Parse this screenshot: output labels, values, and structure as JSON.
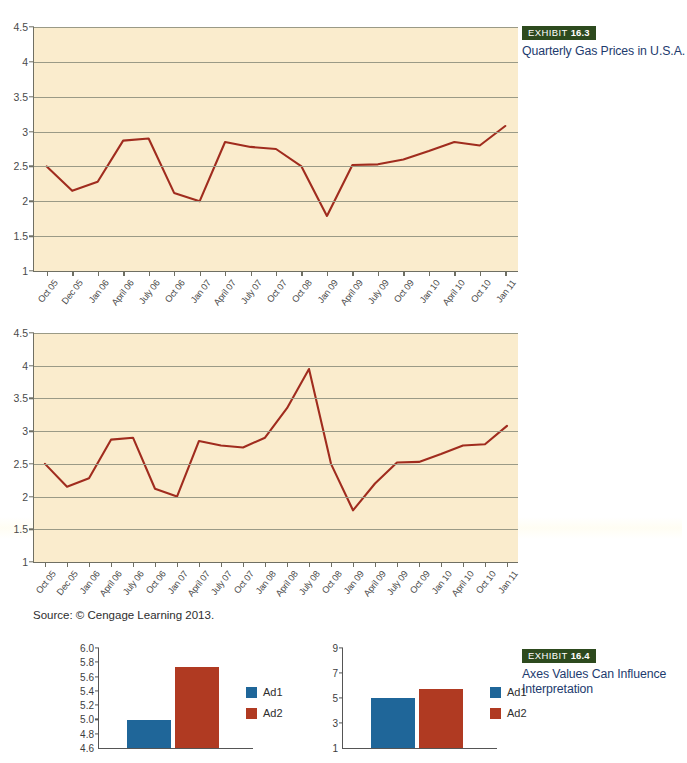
{
  "exhibits": [
    {
      "badge_word": "EXHIBIT",
      "number": "16.3",
      "title": "Quarterly Gas Prices in U.S.A.",
      "badge_color": "#2d4a1e",
      "title_color": "#1d3b6e"
    },
    {
      "badge_word": "EXHIBIT",
      "number": "16.4",
      "title": "Axes Values Can Influence Interpretation",
      "badge_color": "#2d4a1e",
      "title_color": "#1d3b6e"
    }
  ],
  "source_note": "Source: © Cengage Learning 2013.",
  "colors": {
    "plot_background": "#faeccd",
    "line": "#a02c1e",
    "gridline": "#9a9a86",
    "axis": "#6f6f63",
    "ad1_blue": "#1f6699",
    "ad2_red": "#b03a22"
  },
  "chart_data": [
    {
      "type": "line",
      "title": "Quarterly Gas Prices in U.S.A.",
      "id": "gas-prices-compressed-x",
      "xlabel": "",
      "ylabel": "",
      "ylim": [
        1,
        4.5
      ],
      "yticks": [
        1,
        1.5,
        2,
        2.5,
        3,
        3.5,
        4,
        4.5
      ],
      "grid": true,
      "legend": "none",
      "categories": [
        "Oct 05",
        "Dec 05",
        "Jan 06",
        "April 06",
        "July 06",
        "Oct 06",
        "Jan 07",
        "April 07",
        "July 07",
        "Oct 07",
        "Oct 08",
        "Jan 09",
        "April 09",
        "July 09",
        "Oct 09",
        "Jan 10",
        "April 10",
        "Oct 10",
        "Jan 11"
      ],
      "values": [
        2.5,
        2.15,
        2.28,
        2.87,
        2.9,
        2.12,
        2.0,
        2.85,
        2.78,
        2.75,
        2.5,
        1.79,
        2.52,
        2.53,
        2.6,
        2.72,
        2.85,
        2.8,
        3.08
      ]
    },
    {
      "type": "line",
      "title": "Quarterly Gas Prices in U.S.A.",
      "id": "gas-prices-full-x",
      "xlabel": "",
      "ylabel": "",
      "ylim": [
        1,
        4.5
      ],
      "yticks": [
        1,
        1.5,
        2,
        2.5,
        3,
        3.5,
        4,
        4.5
      ],
      "grid": true,
      "legend": "none",
      "categories": [
        "Oct 05",
        "Dec 05",
        "Jan 06",
        "April 06",
        "July 06",
        "Oct 06",
        "Jan 07",
        "April 07",
        "July 07",
        "Oct 07",
        "Jan 08",
        "April 08",
        "July 08",
        "Oct 08",
        "Jan 09",
        "April 09",
        "July 09",
        "Oct 09",
        "Jan 10",
        "April 10",
        "Oct 10",
        "Jan 11"
      ],
      "values": [
        2.5,
        2.15,
        2.28,
        2.87,
        2.9,
        2.12,
        2.0,
        2.85,
        2.78,
        2.75,
        2.9,
        3.35,
        3.95,
        2.5,
        1.79,
        2.2,
        2.52,
        2.53,
        2.65,
        2.78,
        2.8,
        3.08
      ]
    },
    {
      "type": "bar",
      "id": "ad-comparison-zoomed-axis",
      "title": "",
      "xlabel": "",
      "ylabel": "",
      "ylim": [
        4.6,
        6.0
      ],
      "yticks": [
        4.6,
        4.8,
        5.0,
        5.2,
        5.4,
        5.6,
        5.8,
        6.0
      ],
      "ytick_labels": [
        "4.6",
        "4.8",
        "5.0",
        "5.2",
        "5.4",
        "5.6",
        "5.8",
        "6.0"
      ],
      "categories": [
        "Ad1",
        "Ad2"
      ],
      "values": [
        4.99,
        5.74
      ],
      "legend": [
        "Ad1",
        "Ad2"
      ],
      "legend_position": "right"
    },
    {
      "type": "bar",
      "id": "ad-comparison-full-axis",
      "title": "",
      "xlabel": "",
      "ylabel": "",
      "ylim": [
        1,
        9
      ],
      "yticks": [
        1,
        3,
        5,
        7,
        9
      ],
      "ytick_labels": [
        "1",
        "3",
        "5",
        "7",
        "9"
      ],
      "categories": [
        "Ad1",
        "Ad2"
      ],
      "values": [
        4.99,
        5.74
      ],
      "legend": [
        "Ad1",
        "Ad2"
      ],
      "legend_position": "right"
    }
  ]
}
